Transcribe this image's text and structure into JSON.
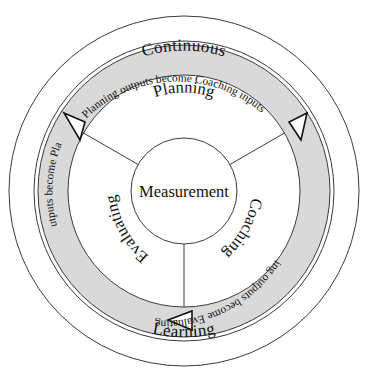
{
  "diagram": {
    "type": "cyclical-process-ring",
    "center": {
      "label": "Measurement"
    },
    "outer_ring_labels": {
      "top": "Continuous",
      "bottom": "Learning"
    },
    "segments": [
      {
        "id": "planning",
        "label": "Planning"
      },
      {
        "id": "coaching",
        "label": "Coaching"
      },
      {
        "id": "evaluating",
        "label": "Evaluating"
      }
    ],
    "band_flows": [
      {
        "id": "planning-to-coaching",
        "text": "Planning outputs become Coaching inputs"
      },
      {
        "id": "coaching-to-evaluating",
        "text": "Coaching outputs become Evaluating inputs"
      },
      {
        "id": "evaluating-to-planning",
        "text": "Evaluating outputs become Planning inputs"
      }
    ],
    "arrowheads": [
      {
        "id": "arrow-upper-left"
      },
      {
        "id": "arrow-upper-right"
      },
      {
        "id": "arrow-bottom"
      }
    ],
    "colors": {
      "band": "#d9d9d9",
      "stroke": "#3a3a3a",
      "text": "#111111",
      "background": "#ffffff"
    }
  }
}
